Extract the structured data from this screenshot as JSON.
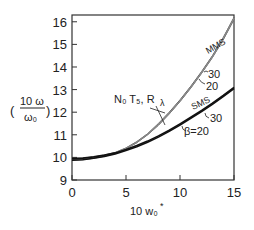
{
  "chart_data": {
    "type": "line",
    "title": "",
    "xlabel": "10 w₀*",
    "ylabel": "(10ω/ω₀)",
    "ylabel_parts": {
      "numerator": "10 ω",
      "denominator": "ω₀"
    },
    "xlim": [
      0,
      15
    ],
    "ylim": [
      9,
      16.3
    ],
    "x_ticks": [
      0,
      5,
      10,
      15
    ],
    "y_ticks": [
      9,
      10,
      11,
      12,
      13,
      14,
      15,
      16
    ],
    "x": [
      0,
      1,
      2,
      3,
      4,
      5,
      6,
      7,
      8,
      9,
      10,
      11,
      12,
      13,
      14,
      15
    ],
    "series": [
      {
        "name": "MMS β=30",
        "group": "MMS",
        "beta": 30,
        "values": [
          9.95,
          9.97,
          10.02,
          10.1,
          10.22,
          10.42,
          10.7,
          11.05,
          11.5,
          12.0,
          12.55,
          13.15,
          13.8,
          14.5,
          15.3,
          16.2
        ]
      },
      {
        "name": "MMS β=20",
        "group": "MMS",
        "beta": 20,
        "values": [
          9.88,
          9.9,
          9.96,
          10.05,
          10.18,
          10.38,
          10.65,
          11.0,
          11.42,
          11.92,
          12.47,
          13.07,
          13.72,
          14.42,
          15.2,
          16.1
        ]
      },
      {
        "name": "N₀T₅,R_λ",
        "group": "numerical",
        "values": [
          9.92,
          9.94,
          9.99,
          10.08,
          10.2,
          10.4,
          10.67,
          11.02,
          11.45,
          11.95,
          12.5,
          13.1,
          13.75,
          14.45,
          15.25,
          16.15
        ]
      },
      {
        "name": "SMS β=30",
        "group": "SMS",
        "beta": 30,
        "values": [
          9.95,
          9.97,
          10.02,
          10.1,
          10.2,
          10.35,
          10.52,
          10.72,
          10.95,
          11.2,
          11.48,
          11.78,
          12.08,
          12.4,
          12.74,
          13.1
        ]
      },
      {
        "name": "SMS β=20",
        "group": "SMS",
        "beta": 20,
        "values": [
          9.88,
          9.9,
          9.96,
          10.04,
          10.15,
          10.3,
          10.47,
          10.67,
          10.9,
          11.15,
          11.43,
          11.73,
          12.03,
          12.35,
          12.69,
          13.05
        ]
      }
    ],
    "annotations": [
      "MMS",
      "30",
      "20",
      "N₀ T₅, R_λ",
      "SMS",
      "30",
      "β=20"
    ],
    "grid": false,
    "legend": "none (inline labels)"
  },
  "labels": {
    "mms": "MMS",
    "mms_30": "30",
    "mms_20": "20",
    "numerical": "N₀ T₅, R",
    "numerical_sub": "λ",
    "sms": "SMS",
    "sms_30": "30",
    "sms_beta20": "β=20",
    "y_num": "10 ω",
    "y_den": "ω₀",
    "x_label": "10 w₀",
    "x_label_sup": "*"
  },
  "ticks": {
    "x": [
      "0",
      "5",
      "10",
      "15"
    ],
    "y": [
      "9",
      "10",
      "11",
      "12",
      "13",
      "14",
      "15",
      "16"
    ]
  }
}
